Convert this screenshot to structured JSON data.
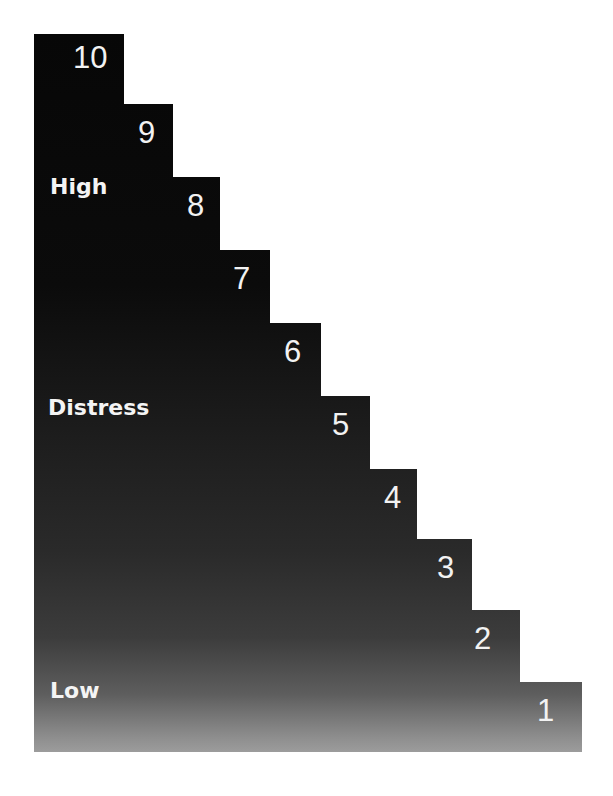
{
  "diagram": {
    "type": "staircase-scale",
    "levels": [
      {
        "value": "10"
      },
      {
        "value": "9"
      },
      {
        "value": "8"
      },
      {
        "value": "7"
      },
      {
        "value": "6"
      },
      {
        "value": "5"
      },
      {
        "value": "4"
      },
      {
        "value": "3"
      },
      {
        "value": "2"
      },
      {
        "value": "1"
      }
    ],
    "labels": {
      "high": "High",
      "distress": "Distress",
      "low": "Low"
    },
    "colors": {
      "top": "#070707",
      "bottom": "#9c9c9c",
      "text": "#f2f2f2",
      "background": "#ffffff"
    }
  }
}
